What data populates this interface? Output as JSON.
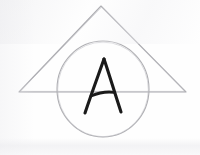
{
  "figure": {
    "background_color": "#fefefe",
    "canvas": {
      "width": 200,
      "height": 155
    },
    "shapes": {
      "triangle": {
        "label": "triangle",
        "stroke_color": "#a3a3a8",
        "stroke_width": 1,
        "fill": "none",
        "points": "101,6 186,92 19,92",
        "vertices": [
          {
            "name": "apex",
            "x": 101,
            "y": 6
          },
          {
            "name": "base-right",
            "x": 186,
            "y": 92
          },
          {
            "name": "base-left",
            "x": 19,
            "y": 92
          }
        ]
      },
      "circle": {
        "label": "circle",
        "stroke_color": "#aaaaae",
        "stroke_width": 1,
        "fill": "none",
        "center_x": 103,
        "center_y": 89,
        "radius_x": 46,
        "radius_y": 48
      },
      "letter": {
        "label": "A",
        "text": "A",
        "stroke_color": "#1a1a1a",
        "stroke_width": 3,
        "apex": {
          "x": 104,
          "y": 59
        },
        "left_foot": {
          "x": 85,
          "y": 113
        },
        "right_foot": {
          "x": 121,
          "y": 112
        },
        "crossbar_y": 94
      }
    }
  }
}
